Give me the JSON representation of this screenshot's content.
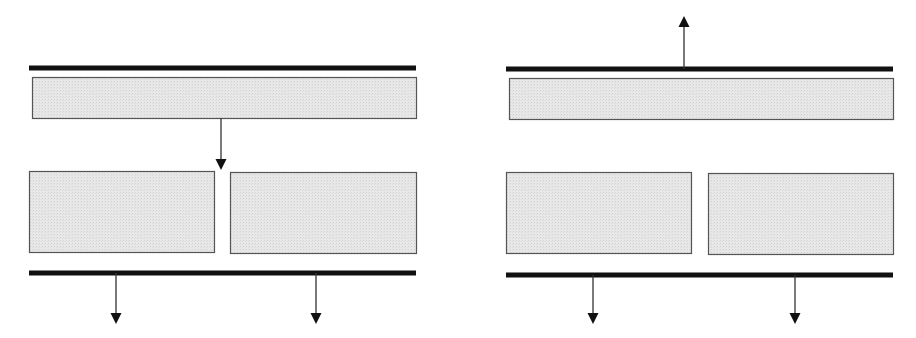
{
  "diagram": {
    "canvas": {
      "width": 916,
      "height": 338,
      "background": "#ffffff"
    },
    "colors": {
      "bar": "#111111",
      "block_fill": "#e6e6e6",
      "block_stroke": "#555555",
      "arrow": "#333333",
      "arrowhead": "#111111"
    },
    "panels": [
      {
        "id": "left",
        "bars": [
          {
            "role": "top-bar",
            "x1": 29,
            "x2": 416,
            "y": 68,
            "thickness": 5
          },
          {
            "role": "bottom-bar",
            "x1": 29,
            "x2": 416,
            "y": 273,
            "thickness": 5
          }
        ],
        "blocks": [
          {
            "role": "top-block",
            "x": 32,
            "y": 77,
            "w": 384,
            "h": 41
          },
          {
            "role": "bottom-left-block",
            "x": 29,
            "y": 171,
            "w": 185,
            "h": 81
          },
          {
            "role": "bottom-right-block",
            "x": 230,
            "y": 172,
            "w": 186,
            "h": 81
          }
        ],
        "arrows": [
          {
            "role": "internal-down-arrow",
            "x": 221,
            "y1": 118,
            "y2": 170,
            "direction": "down"
          },
          {
            "role": "output-down-arrow-left",
            "x": 116,
            "y1": 273,
            "y2": 324,
            "direction": "down"
          },
          {
            "role": "output-down-arrow-right",
            "x": 316,
            "y1": 273,
            "y2": 324,
            "direction": "down"
          }
        ]
      },
      {
        "id": "right",
        "bars": [
          {
            "role": "top-bar",
            "x1": 506,
            "x2": 893,
            "y": 69,
            "thickness": 5
          },
          {
            "role": "bottom-bar",
            "x1": 506,
            "x2": 893,
            "y": 275,
            "thickness": 5
          }
        ],
        "blocks": [
          {
            "role": "top-block",
            "x": 509,
            "y": 78,
            "w": 384,
            "h": 41
          },
          {
            "role": "bottom-left-block",
            "x": 506,
            "y": 172,
            "w": 185,
            "h": 81
          },
          {
            "role": "bottom-right-block",
            "x": 708,
            "y": 173,
            "w": 185,
            "h": 81
          }
        ],
        "arrows": [
          {
            "role": "output-up-arrow",
            "x": 684,
            "y1": 69,
            "y2": 16,
            "direction": "up"
          },
          {
            "role": "output-down-arrow-left",
            "x": 593,
            "y1": 275,
            "y2": 324,
            "direction": "down"
          },
          {
            "role": "output-down-arrow-right",
            "x": 795,
            "y1": 275,
            "y2": 324,
            "direction": "down"
          }
        ]
      }
    ]
  }
}
